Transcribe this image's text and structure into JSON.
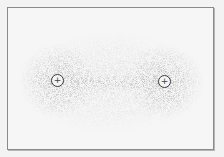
{
  "diagram": {
    "type": "electron density cloud between two nuclei",
    "nuclei": [
      {
        "label": "+",
        "cx": 57,
        "cy": 80
      },
      {
        "label": "+",
        "cx": 164,
        "cy": 81
      }
    ],
    "colors": {
      "background": "#f3f3f3",
      "frame": "#8a8a8a",
      "dots": "#555555",
      "nucleus_border": "#3a3a3a"
    }
  }
}
